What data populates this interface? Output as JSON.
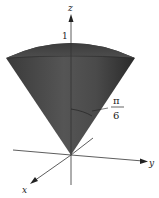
{
  "figure": {
    "axes": {
      "x_label": "x",
      "y_label": "y",
      "z_label": "z"
    },
    "annotations": {
      "radius_label": "1",
      "angle_numerator": "π",
      "angle_denominator": "6"
    },
    "colors": {
      "solid_dark": "#2e2e2e",
      "solid_mid": "#5a5a5a",
      "axis": "#333333",
      "background": "#ffffff"
    }
  }
}
